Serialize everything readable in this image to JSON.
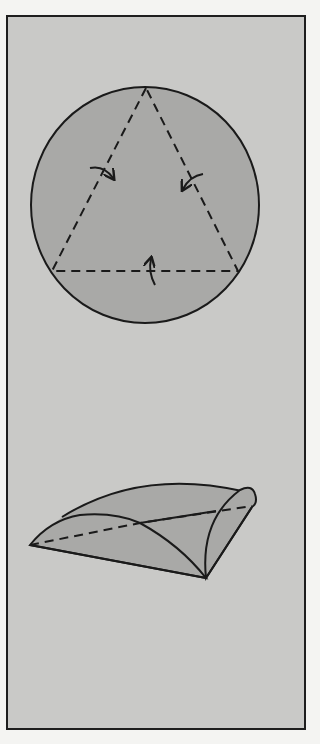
{
  "figure": {
    "type": "origami-fold-instructions",
    "steps": [
      {
        "step": 1,
        "description": "circle-with-inscribed-triangle-fold-lines",
        "shape": "circle",
        "fold_lines": "dashed-equilateral-triangle",
        "arrows": [
          "fold-left-flap-inward",
          "fold-right-flap-inward",
          "fold-bottom-flap-up"
        ]
      },
      {
        "step": 2,
        "description": "folded-triangular-base-with-curved-flaps",
        "shape": "folded-cone"
      }
    ]
  },
  "colors": {
    "page_bg": "#f4f4f2",
    "frame_bg": "#c9c9c7",
    "frame_border": "#1e1e1e",
    "paper_fill": "#a9a9a7",
    "line": "#1a1a1a"
  }
}
